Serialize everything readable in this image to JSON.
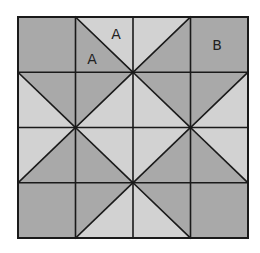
{
  "diagram": {
    "type": "quilt-block",
    "grid": {
      "rows": 4,
      "cols": 4
    },
    "bounds": {
      "x": 18,
      "y": 17,
      "width": 230,
      "height": 221
    },
    "colors": {
      "dark": "#a9a9a9",
      "light": "#d2d2d2",
      "line": "#1a1a1a",
      "background": "#ffffff"
    },
    "cells": [
      [
        {
          "kind": "solid",
          "fill": "dark"
        },
        {
          "kind": "diag-tlbr",
          "upper": "light",
          "lower": "dark"
        },
        {
          "kind": "diag-bltr",
          "upper": "light",
          "lower": "dark"
        },
        {
          "kind": "solid",
          "fill": "dark"
        }
      ],
      [
        {
          "kind": "diag-tlbr",
          "upper": "dark",
          "lower": "light"
        },
        {
          "kind": "diag-bltr",
          "upper": "dark",
          "lower": "light"
        },
        {
          "kind": "diag-tlbr",
          "upper": "dark",
          "lower": "light"
        },
        {
          "kind": "diag-bltr",
          "upper": "dark",
          "lower": "light"
        }
      ],
      [
        {
          "kind": "diag-bltr",
          "upper": "light",
          "lower": "dark"
        },
        {
          "kind": "diag-tlbr",
          "upper": "light",
          "lower": "dark"
        },
        {
          "kind": "diag-bltr",
          "upper": "light",
          "lower": "dark"
        },
        {
          "kind": "diag-tlbr",
          "upper": "light",
          "lower": "dark"
        }
      ],
      [
        {
          "kind": "solid",
          "fill": "dark"
        },
        {
          "kind": "diag-bltr",
          "upper": "dark",
          "lower": "light"
        },
        {
          "kind": "diag-tlbr",
          "upper": "dark",
          "lower": "light"
        },
        {
          "kind": "solid",
          "fill": "dark"
        }
      ]
    ],
    "labels": [
      {
        "text": "A",
        "x": 116,
        "y": 39,
        "region": "upper-right triangle of row 0 col 1"
      },
      {
        "text": "A",
        "x": 92,
        "y": 64,
        "region": "lower-left triangle of row 0 col 1"
      },
      {
        "text": "B",
        "x": 217,
        "y": 50,
        "region": "solid square row 0 col 3"
      }
    ]
  }
}
